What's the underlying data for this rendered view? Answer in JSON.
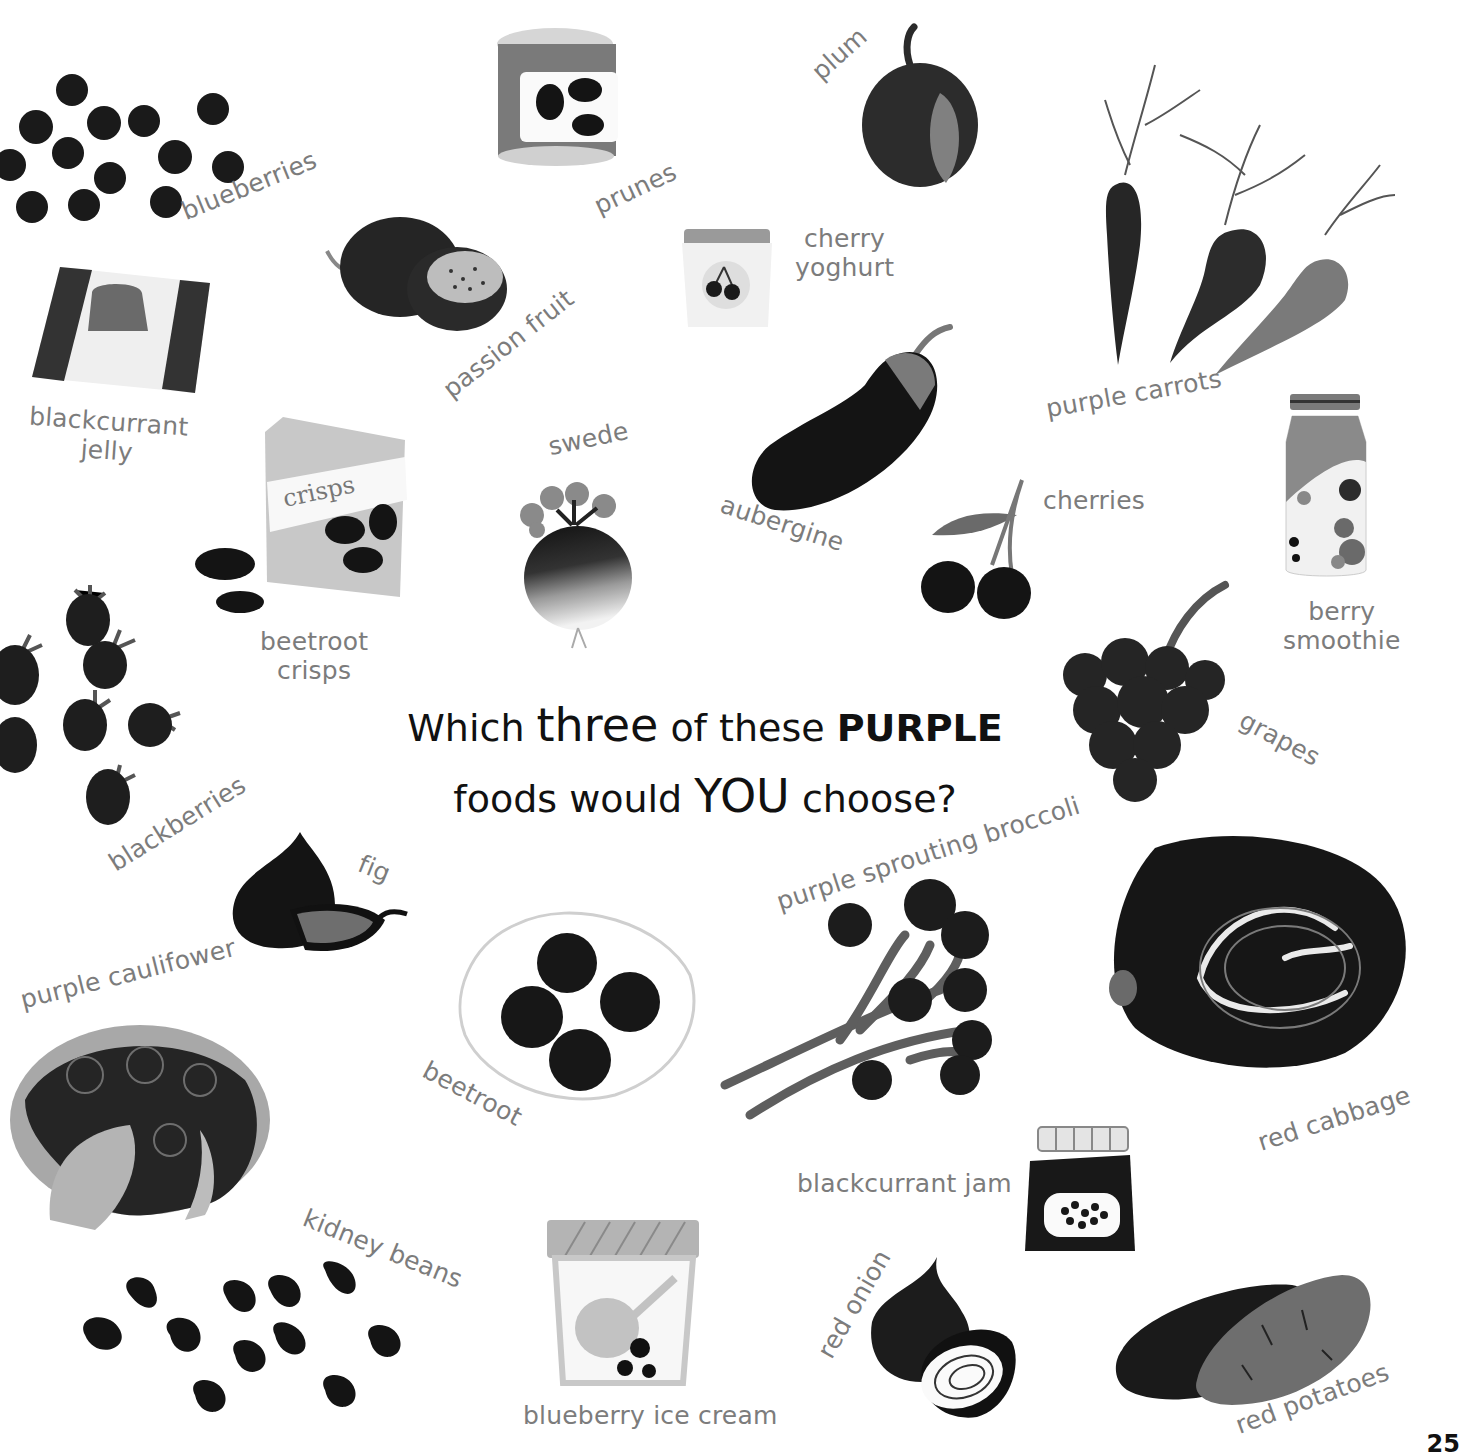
{
  "page": {
    "question": {
      "part1": "Which",
      "emph1": "three",
      "part2": "of these",
      "emph2": "PURPLE",
      "part3": "foods would",
      "emph3": "YOU",
      "part4": "choose?"
    },
    "page_number": "25",
    "colors": {
      "background": "#ffffff",
      "label_gray": "#7c7c7c",
      "title_black": "#111111",
      "dark_fill": "#1e1e1e",
      "mid_gray": "#6e6e6e",
      "light_gray": "#c8c8c8"
    }
  },
  "foods": [
    {
      "id": "blueberries",
      "label": "blueberries",
      "icon": "blueberries-icon"
    },
    {
      "id": "prunes",
      "label": "prunes",
      "icon": "prunes-can-icon"
    },
    {
      "id": "plum",
      "label": "plum",
      "icon": "plum-icon"
    },
    {
      "id": "purple_carrots",
      "label": "purple carrots",
      "icon": "carrots-icon"
    },
    {
      "id": "passion_fruit",
      "label": "passion fruit",
      "icon": "passion-fruit-icon"
    },
    {
      "id": "cherry_yoghurt",
      "label_line1": "cherry",
      "label_line2": "yoghurt",
      "icon": "yoghurt-pot-icon"
    },
    {
      "id": "blackcurrant_jelly",
      "label_line1": "blackcurrant",
      "label_line2": "jelly",
      "icon": "jelly-icon"
    },
    {
      "id": "swede",
      "label": "swede",
      "icon": "swede-icon"
    },
    {
      "id": "aubergine",
      "label": "aubergine",
      "icon": "aubergine-icon"
    },
    {
      "id": "cherries",
      "label": "cherries",
      "icon": "cherries-icon"
    },
    {
      "id": "berry_smoothie",
      "label_line1": "berry",
      "label_line2": "smoothie",
      "icon": "smoothie-jar-icon"
    },
    {
      "id": "beetroot_crisps",
      "label_line1": "beetroot",
      "label_line2": "crisps",
      "icon": "crisps-bag-icon",
      "bag_text": "crisps"
    },
    {
      "id": "grapes",
      "label": "grapes",
      "icon": "grapes-icon"
    },
    {
      "id": "blackberries",
      "label": "blackberries",
      "icon": "blackberries-icon"
    },
    {
      "id": "fig",
      "label": "fig",
      "icon": "fig-icon"
    },
    {
      "id": "purple_sprouting_broccoli",
      "label": "purple sprouting broccoli",
      "icon": "broccoli-icon"
    },
    {
      "id": "red_cabbage",
      "label": "red cabbage",
      "icon": "cabbage-icon"
    },
    {
      "id": "purple_caulifower",
      "label": "purple caulifower",
      "icon": "cauliflower-icon"
    },
    {
      "id": "beetroot",
      "label": "beetroot",
      "icon": "beetroot-plate-icon"
    },
    {
      "id": "blackcurrant_jam",
      "label": "blackcurrant jam",
      "icon": "jam-jar-icon"
    },
    {
      "id": "kidney_beans",
      "label": "kidney beans",
      "icon": "kidney-beans-icon"
    },
    {
      "id": "blueberry_ice_cream",
      "label": "blueberry ice cream",
      "icon": "ice-cream-tub-icon"
    },
    {
      "id": "red_onion",
      "label": "red onion",
      "icon": "red-onion-icon"
    },
    {
      "id": "red_potatoes",
      "label": "red potatoes",
      "icon": "potatoes-icon"
    }
  ]
}
